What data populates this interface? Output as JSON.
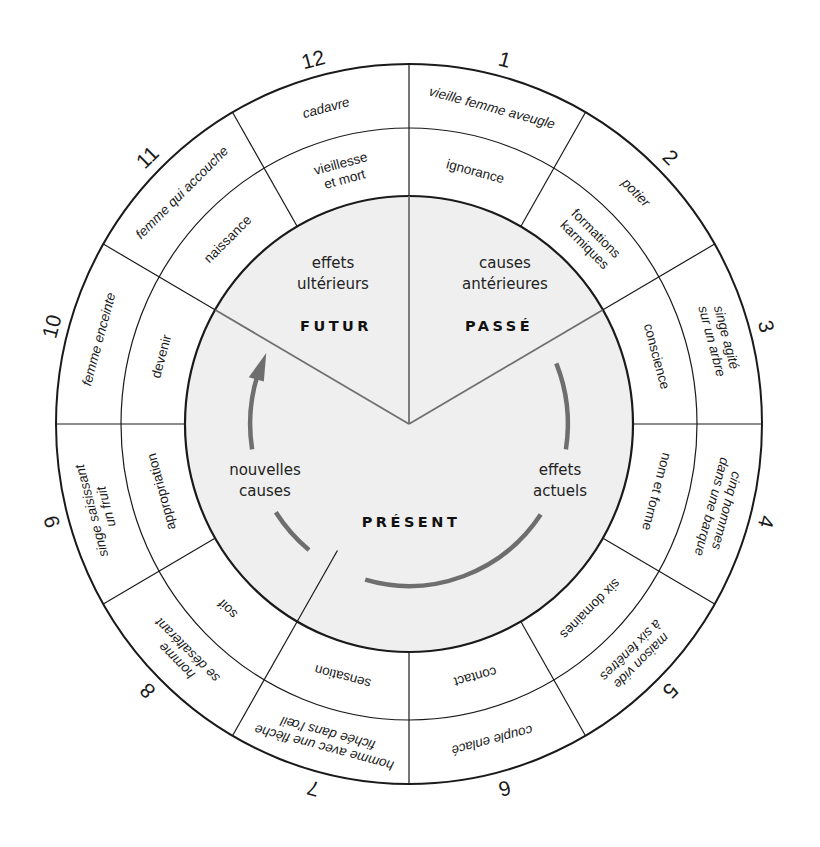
{
  "diagram": {
    "center": {
      "x": 409,
      "y": 424
    },
    "radii": {
      "outer": {
        "rx": 353,
        "ry": 360
      },
      "middle": {
        "rx": 288,
        "ry": 296
      },
      "inner": {
        "rx": 224,
        "ry": 228
      },
      "arrows": 162
    },
    "colors": {
      "stroke": "#1a1a1a",
      "inner_fill": "#efefef",
      "inner_divider": "#6f6f6f",
      "arrow": "#6e6e6e",
      "background": "#ffffff"
    },
    "segments": [
      {
        "number": "1",
        "outer": [
          "vieille femme aveugle"
        ],
        "middle": [
          "ignorance"
        ]
      },
      {
        "number": "2",
        "outer": [
          "potier"
        ],
        "middle": [
          "formations",
          "karmiques"
        ]
      },
      {
        "number": "3",
        "outer": [
          "singe agité",
          "sur un arbre"
        ],
        "middle": [
          "conscience"
        ]
      },
      {
        "number": "4",
        "outer": [
          "cinq hommes",
          "dans une barque"
        ],
        "middle": [
          "nom et forme"
        ]
      },
      {
        "number": "5",
        "outer": [
          "maison vide",
          "à six fenêtres"
        ],
        "middle": [
          "six domaines"
        ]
      },
      {
        "number": "6",
        "outer": [
          "couple enlacé"
        ],
        "middle": [
          "contact"
        ]
      },
      {
        "number": "7",
        "outer": [
          "homme avec une flèche",
          "fichée dans l'œil"
        ],
        "middle": [
          "sensation"
        ]
      },
      {
        "number": "8",
        "outer": [
          "homme",
          "se désaltérant"
        ],
        "middle": [
          "soif"
        ]
      },
      {
        "number": "9",
        "outer": [
          "singe saisissant",
          "un fruit"
        ],
        "middle": [
          "appropriation"
        ]
      },
      {
        "number": "10",
        "outer": [
          "femme enceinte"
        ],
        "middle": [
          "devenir"
        ]
      },
      {
        "number": "11",
        "outer": [
          "femme qui accouche"
        ],
        "middle": [
          "naissance"
        ]
      },
      {
        "number": "12",
        "outer": [
          "cadavre"
        ],
        "middle": [
          "vieillesse",
          "et mort"
        ]
      }
    ],
    "periods": [
      {
        "key": "futur",
        "name": "FUTUR",
        "sub": [
          "effets",
          "ultérieurs"
        ]
      },
      {
        "key": "passe",
        "name": "PASSÉ",
        "sub": [
          "causes",
          "antérieures"
        ]
      },
      {
        "key": "present",
        "name": "PRÉSENT",
        "sub_left": [
          "nouvelles",
          "causes"
        ],
        "sub_right": [
          "effets",
          "actuels"
        ]
      }
    ]
  }
}
